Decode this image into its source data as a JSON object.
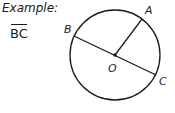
{
  "example": {
    "label": "Example:",
    "answer": "BC"
  },
  "diagram": {
    "circle": {
      "cx": 115,
      "cy": 55,
      "r": 45
    },
    "center": {
      "label": "O",
      "x": 115,
      "y": 55
    },
    "points": [
      {
        "label": "A",
        "x": 143,
        "y": 19
      },
      {
        "label": "B",
        "x": 74,
        "y": 35
      },
      {
        "label": "C",
        "x": 156,
        "y": 75
      }
    ],
    "segments": [
      {
        "from": "B",
        "to": "C",
        "type": "diameter"
      },
      {
        "from": "O",
        "to": "A",
        "type": "radius"
      }
    ],
    "stroke_color": "#1a1a1a"
  }
}
